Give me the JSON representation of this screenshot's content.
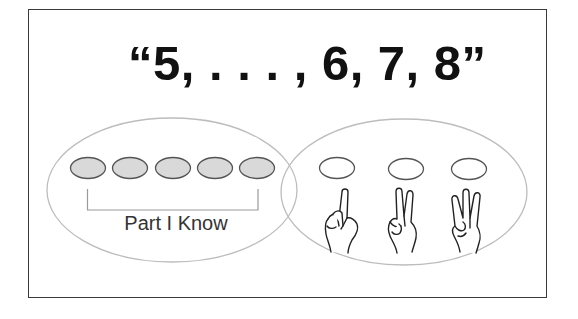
{
  "diagram": {
    "heading": "“5, . . . , 6, 7, 8”",
    "known_part": {
      "label": "Part I Know",
      "count": 5,
      "fill_color": "#d9d9d9"
    },
    "counting_part": {
      "count": 3,
      "hand_gestures": [
        "one-finger-hand-icon",
        "two-finger-hand-icon",
        "three-finger-hand-icon"
      ]
    },
    "colors": {
      "border": "#3a3a3a",
      "ellipse_outline": "#bdbdbd",
      "oval_outline": "#555555",
      "text": "#111111"
    }
  }
}
